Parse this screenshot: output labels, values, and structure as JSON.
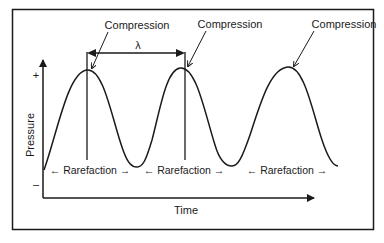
{
  "diagram": {
    "title": "",
    "y_axis": {
      "label": "Pressure",
      "plus": "+",
      "minus": "–"
    },
    "x_axis": {
      "label": "Time"
    },
    "wavelength_symbol": "λ",
    "compression_labels": [
      "Compression",
      "Compression",
      "Compression"
    ],
    "rarefaction_labels": [
      "← Rarefaction →",
      "← Rarefaction →",
      "← Rarefaction →"
    ],
    "colors": {
      "stroke": "#1a1a1a",
      "background": "#ffffff"
    }
  }
}
